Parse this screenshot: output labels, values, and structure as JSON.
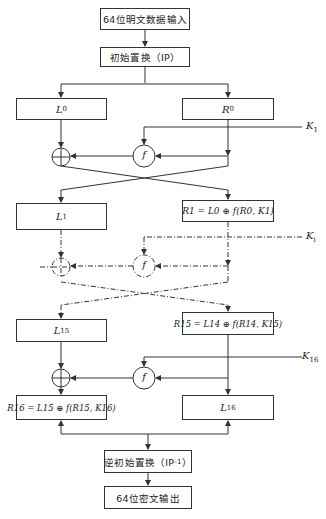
{
  "diagram": {
    "input_box": "64位明文数据输入",
    "ip_box": "初始置换（IP）",
    "inverse_ip_box": {
      "prefix": "逆初始置换（IP",
      "sup": "-1",
      "suffix": "）"
    },
    "output_box": "64位密文输出",
    "round1": {
      "left": {
        "var": "L",
        "sub": "0"
      },
      "right": {
        "var": "R",
        "sub": "0"
      },
      "key": {
        "var": "K",
        "sub": "1"
      },
      "f": "f"
    },
    "round_i": {
      "left": {
        "var": "L",
        "sub": "1"
      },
      "right_formula": "R1 = L0 ⊕ f(R0, K1)",
      "key": {
        "var": "K",
        "sub": "i"
      },
      "f": "f"
    },
    "round16": {
      "left": {
        "var": "L",
        "sub": "15"
      },
      "right_formula": "R15 = L14 ⊕ f(R14, K15)",
      "key": {
        "var": "K",
        "sub": "16"
      },
      "f": "f"
    },
    "final": {
      "left_formula": "R16 = L15 ⊕ f(R15, K16)",
      "right": {
        "var": "L",
        "sub": "16"
      }
    },
    "colors": {
      "line": "#333333",
      "background": "#ffffff"
    }
  }
}
